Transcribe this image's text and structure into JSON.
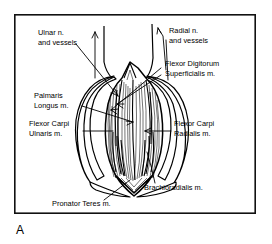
{
  "figure": {
    "caption": "A",
    "title_present": false,
    "background_color": "#ffffff",
    "ink_color": "#000000",
    "frame": {
      "x": 14,
      "y": 14,
      "width": 242,
      "height": 200,
      "stroke_color": "#111111"
    }
  },
  "labels": [
    {
      "id": "ulnar-nerve-vessels",
      "line1": "Ulnar n.",
      "line2": "and vessels",
      "align": "start",
      "x": 38,
      "y": 33
    },
    {
      "id": "radial-nerve-vessels",
      "line1": "Radial n.",
      "line2": "and vessels",
      "align": "start",
      "x": 169,
      "y": 31
    },
    {
      "id": "flexor-digitorum-superficialis",
      "line1": "Flexor Digitorum",
      "line2": "Superficialis m.",
      "align": "start",
      "x": 165,
      "y": 64
    },
    {
      "id": "palmaris-longus",
      "line1": "Palmaris",
      "line2": "Longus m.",
      "align": "start",
      "x": 34,
      "y": 96
    },
    {
      "id": "flexor-carpi-ulnaris",
      "line1": "Flexor Carpi",
      "line2": "Ulnaris m.",
      "align": "start",
      "x": 29,
      "y": 124
    },
    {
      "id": "flexor-carpi-radialis",
      "line1": "Flexor Carpi",
      "line2": "Radialis m.",
      "align": "start",
      "x": 174,
      "y": 124
    },
    {
      "id": "brachioradialis",
      "line1": "Brachioradialis m.",
      "line2": "",
      "align": "start",
      "x": 144,
      "y": 188
    },
    {
      "id": "pronator-teres",
      "line1": "Pronator Teres m.",
      "line2": "",
      "align": "start",
      "x": 52,
      "y": 204
    }
  ]
}
